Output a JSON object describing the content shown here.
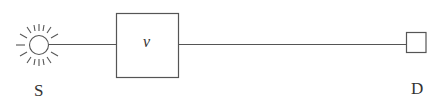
{
  "diagram": {
    "source": {
      "label": "S",
      "icon": "sun-icon"
    },
    "element": {
      "label": "v"
    },
    "detector": {
      "label": "D",
      "icon": "square-detector-icon"
    },
    "colors": {
      "stroke": "#555555",
      "text": "#333333",
      "background": "#ffffff"
    }
  }
}
